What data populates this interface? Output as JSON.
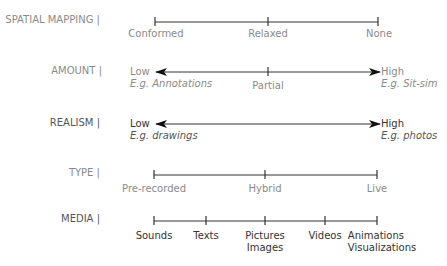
{
  "rows": [
    {
      "label": "SPATIAL MAPPING |",
      "kind": "scale",
      "ticks": [
        "Conformed",
        "Relaxed",
        "None"
      ]
    },
    {
      "label": "AMOUNT |",
      "kind": "arrow",
      "low": {
        "label": "Low",
        "example": "E.g. Annotations"
      },
      "high": {
        "label": "High",
        "example": "E.g. Sit-sim"
      },
      "middle": "Partial"
    },
    {
      "label": "REALISM |",
      "kind": "arrow",
      "low": {
        "label": "Low",
        "example": "E.g. drawings"
      },
      "high": {
        "label": "High",
        "example": "E.g. photos"
      }
    },
    {
      "label": "TYPE |",
      "kind": "scale",
      "ticks": [
        "Pre-recorded",
        "Hybrid",
        "Live"
      ]
    },
    {
      "label": "MEDIA |",
      "kind": "scale",
      "ticks": [
        "Sounds",
        "Texts",
        "Pictures",
        "Videos",
        "Animations"
      ],
      "ticks_line2": [
        "",
        "",
        "Images",
        "",
        "Visualizations"
      ]
    }
  ],
  "colors": {
    "line": "#333333",
    "label_light": "#8a8a8a",
    "label_dark": "#333333"
  }
}
